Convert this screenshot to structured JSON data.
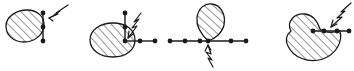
{
  "figure": {
    "width": 354,
    "height": 71,
    "background_color": "#ffffff",
    "ink_color": "#1a1a1a",
    "hatch_color": "#2b2b2b",
    "panel_count": 4,
    "panels": [
      {
        "id": "panel-1",
        "name": "ellipse-with-vertical-edge",
        "region_shape": "tilted-ellipse",
        "region_fill": "diagonal-hatching",
        "chain_orientation": "vertical",
        "vertex_count": 3,
        "arrow_style": "zigzag-shaft-arrow",
        "arrow_direction": "down-left",
        "arrow_target": "upper-vertex"
      },
      {
        "id": "panel-2",
        "name": "ellipse-with-corner-chain",
        "region_shape": "ellipse",
        "region_fill": "diagonal-hatching",
        "chain_orientation": "L-shaped",
        "vertex_count": 5,
        "arrow_style": "zigzag-shaft-arrow",
        "arrow_direction": "down-left",
        "arrow_target": "corner-vertex"
      },
      {
        "id": "panel-3",
        "name": "teardrop-on-horizontal-chain",
        "region_shape": "teardrop",
        "region_fill": "diagonal-hatching",
        "chain_orientation": "horizontal",
        "vertex_count": 6,
        "arrow_style": "zigzag-shaft-arrow",
        "arrow_direction": "up",
        "arrow_target": "center-vertex"
      },
      {
        "id": "panel-4",
        "name": "crescent-with-horizontal-chain",
        "region_shape": "crescent",
        "region_fill": "diagonal-hatching",
        "chain_orientation": "horizontal",
        "vertex_count": 4,
        "arrow_style": "zigzag-shaft-arrow",
        "arrow_direction": "down-left",
        "arrow_target": "concave-boundary-vertex"
      }
    ]
  }
}
